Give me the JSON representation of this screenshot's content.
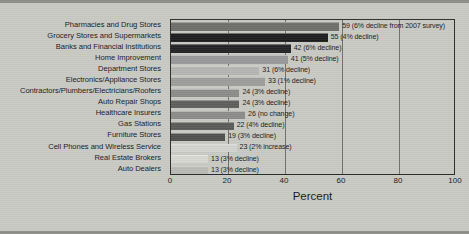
{
  "chart_data": {
    "type": "bar",
    "title": "",
    "xlabel": "Percent",
    "ylabel": "",
    "xlim": [
      0,
      100
    ],
    "xticks": [
      "0",
      "20",
      "40",
      "60",
      "80",
      "100"
    ],
    "grid": true,
    "orientation": "horizontal",
    "legend": "none",
    "categories": [
      "Pharmacies and Drug Stores",
      "Grocery Stores and Supermarkets",
      "Banks and Financial Institutions",
      "Home Improvement",
      "Department Stores",
      "Electronics/Appliance Stores",
      "Contractors/Plumbers/Electricians/Roofers",
      "Auto Repair Shops",
      "Healthcare Insurers",
      "Gas Stations",
      "Furniture Stores",
      "Cell Phones and Wireless Service",
      "Real Estate Brokers",
      "Auto Dealers"
    ],
    "values": [
      59,
      55,
      42,
      41,
      31,
      33,
      24,
      24,
      26,
      22,
      19,
      23,
      13,
      13
    ],
    "annotations": [
      "59 (6% decline from 2007 survey)",
      "55 (4% decline)",
      "42 (6% decline)",
      "41 (5% decline)",
      "31 (6% decline)",
      "33 (1% decline)",
      "24 (3% decline)",
      "24 (3% decline)",
      "26 (no change)",
      "22 (4% decline)",
      "19 (3% decline)",
      "23 (2% increase)",
      "13 (3% decline)",
      "13 (3% decline)"
    ],
    "bar_colors": [
      "#6e6e6b",
      "#1d1d1f",
      "#232325",
      "#98989a",
      "#b4b4b2",
      "#9d9d9c",
      "#8b8b89",
      "#5e5e5c",
      "#8b8b89",
      "#5a5a58",
      "#4f4f4d",
      "#d2d2cf",
      "#d6d6d3",
      "#b9b9b6"
    ]
  }
}
